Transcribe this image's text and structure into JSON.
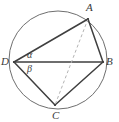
{
  "figure": {
    "kind": "geometry-diagram",
    "width": 119,
    "height": 122,
    "background_color": "#ffffff",
    "circle": {
      "center_x": 58,
      "center_y": 60,
      "radius": 49,
      "stroke_color": "#6f6f6f",
      "stroke_width": 1,
      "fill": "none"
    },
    "vertices": [
      {
        "name": "A",
        "label": "A",
        "x": 88,
        "y": 19,
        "label_x": 86,
        "label_y": 2
      },
      {
        "name": "B",
        "label": "B",
        "x": 103,
        "y": 62,
        "label_x": 106,
        "label_y": 56
      },
      {
        "name": "C",
        "label": "C",
        "x": 55,
        "y": 105,
        "label_x": 52,
        "label_y": 110
      },
      {
        "name": "D",
        "label": "D",
        "x": 14,
        "y": 62,
        "label_x": 1,
        "label_y": 56
      }
    ],
    "segments": [
      {
        "name": "chord-DA",
        "from": "D",
        "to": "A",
        "style": "solid",
        "stroke_color": "#3f3f3f",
        "stroke_width": 1.5
      },
      {
        "name": "chord-AB",
        "from": "A",
        "to": "B",
        "style": "solid",
        "stroke_color": "#3f3f3f",
        "stroke_width": 1.5
      },
      {
        "name": "chord-DB",
        "from": "D",
        "to": "B",
        "style": "solid",
        "stroke_color": "#3f3f3f",
        "stroke_width": 1.5
      },
      {
        "name": "chord-DC",
        "from": "D",
        "to": "C",
        "style": "solid",
        "stroke_color": "#3f3f3f",
        "stroke_width": 1.5
      },
      {
        "name": "chord-CB",
        "from": "C",
        "to": "B",
        "style": "solid",
        "stroke_color": "#3f3f3f",
        "stroke_width": 1.5
      },
      {
        "name": "diagonal-AC",
        "from": "A",
        "to": "C",
        "style": "dashed",
        "stroke_color": "#b4b4b4",
        "stroke_width": 1,
        "dash_pattern": "3,2.5"
      }
    ],
    "angles": [
      {
        "name": "alpha",
        "label": "α",
        "at_vertex": "D",
        "between": [
          "DA",
          "DB"
        ],
        "label_x": 27,
        "label_y": 50
      },
      {
        "name": "beta",
        "label": "β",
        "at_vertex": "D",
        "between": [
          "DB",
          "DC"
        ],
        "label_x": 27,
        "label_y": 64
      }
    ],
    "label_color": "#3a3a3a"
  }
}
